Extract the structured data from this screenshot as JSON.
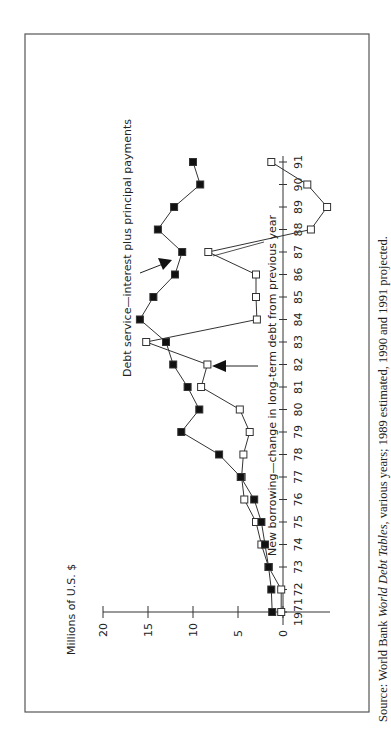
{
  "chart_data": {
    "type": "line",
    "orientation": "rotated 90deg counter-clockwise on page",
    "ylabel": "Millions of U.S. $",
    "xlabel": "",
    "ylim": [
      0,
      20
    ],
    "yticks": [
      0,
      5,
      10,
      15,
      20
    ],
    "x": [
      1971,
      1972,
      1973,
      1974,
      1975,
      1976,
      1977,
      1978,
      1979,
      1980,
      1981,
      1982,
      1983,
      1984,
      1985,
      1986,
      1987,
      1988,
      1989,
      1990,
      1991
    ],
    "x_tick_labels": [
      "1971",
      "72",
      "73",
      "74",
      "75",
      "76",
      "77",
      "78",
      "79",
      "80",
      "81",
      "82",
      "83",
      "84",
      "85",
      "86",
      "87",
      "88",
      "89",
      "90",
      "91"
    ],
    "series": [
      {
        "name": "Debt service—interest plus principal payments",
        "marker": "filled-square",
        "values": [
          1.2,
          1.3,
          1.6,
          2.0,
          2.4,
          3.2,
          4.7,
          7.1,
          11.3,
          9.3,
          10.6,
          12.2,
          13.0,
          15.9,
          14.4,
          12.0,
          11.2,
          13.9,
          12.1,
          9.2,
          10.0
        ]
      },
      {
        "name": "New borrowing—change in long-term debt from previous year",
        "marker": "open-square",
        "values": [
          0.2,
          0.2,
          1.6,
          2.4,
          3.0,
          4.3,
          4.6,
          4.4,
          3.7,
          4.8,
          9.1,
          8.4,
          15.2,
          2.9,
          3.0,
          3.0,
          8.3,
          -3.1,
          -4.9,
          -2.7,
          1.3
        ]
      }
    ],
    "annotations": [
      {
        "text": "Debt service—interest plus principal payments",
        "arrow_to_year": 1987
      },
      {
        "text": "New borrowing—change in long-term debt from previous year",
        "arrow_to_year": 1982
      }
    ],
    "grid": false,
    "legend": "none (inline labels)"
  },
  "axis": {
    "unit_label": "Millions of U.S. $",
    "y_ticks": [
      "20",
      "15",
      "10",
      "5",
      "0"
    ],
    "x_ticks": [
      "1971",
      "72",
      "73",
      "74",
      "75",
      "76",
      "77",
      "78",
      "79",
      "80",
      "81",
      "82",
      "83",
      "84",
      "85",
      "86",
      "87",
      "88",
      "89",
      "90",
      "91"
    ]
  },
  "labels": {
    "debt_service": "Debt service—interest plus principal payments",
    "new_borrowing": "New borrowing—change in long-term debt from previous year"
  },
  "caption": {
    "prefix": "Source: World Bank ",
    "title_italic": "World Debt Tables",
    "suffix": ", various years; 1989 estimated, 1990 and 1991 projected."
  }
}
